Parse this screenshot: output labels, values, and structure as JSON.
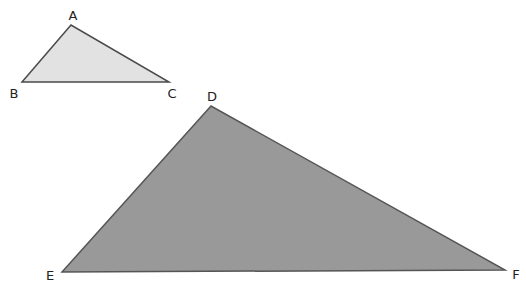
{
  "diagram": {
    "triangles": [
      {
        "name": "ABC",
        "fill": "#e2e2e2",
        "stroke": "#4a4a4a",
        "vertices": [
          {
            "label": "A",
            "x": 71,
            "y": 25,
            "lx": 73,
            "ly": 20
          },
          {
            "label": "B",
            "x": 22,
            "y": 82,
            "lx": 14,
            "ly": 98
          },
          {
            "label": "C",
            "x": 169,
            "y": 82,
            "lx": 172,
            "ly": 98
          }
        ]
      },
      {
        "name": "DEF",
        "fill": "#999999",
        "stroke": "#555555",
        "vertices": [
          {
            "label": "D",
            "x": 211,
            "y": 106,
            "lx": 212,
            "ly": 101
          },
          {
            "label": "E",
            "x": 62,
            "y": 272,
            "lx": 50,
            "ly": 280
          },
          {
            "label": "F",
            "x": 505,
            "y": 270,
            "lx": 516,
            "ly": 279
          }
        ]
      }
    ]
  }
}
